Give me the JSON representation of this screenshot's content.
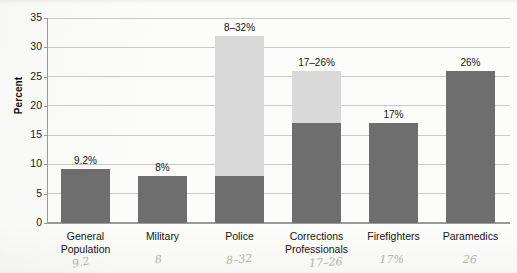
{
  "chart_data": {
    "type": "bar",
    "title": "",
    "xlabel": "",
    "ylabel": "Percent",
    "ylim": [
      0,
      35
    ],
    "ytick_step": 5,
    "yticks": [
      "0",
      "5",
      "10",
      "15",
      "20",
      "25",
      "30",
      "35"
    ],
    "grid": true,
    "legend": "none",
    "categories": [
      "General\nPopulation",
      "Military",
      "Police",
      "Corrections\nProfessionals",
      "Firefighters",
      "Paramedics"
    ],
    "category_lines": [
      [
        "General",
        "Population"
      ],
      [
        "Military",
        ""
      ],
      [
        "Police",
        ""
      ],
      [
        "Corrections",
        "Professionals"
      ],
      [
        "Firefighters",
        ""
      ],
      [
        "Paramedics",
        ""
      ]
    ],
    "series": [
      {
        "name": "Lower bound",
        "values": [
          9.2,
          8,
          8,
          17,
          17,
          26
        ]
      },
      {
        "name": "Upper bound",
        "values": [
          9.2,
          8,
          32,
          26,
          17,
          26
        ]
      }
    ],
    "data_labels": [
      "9.2%",
      "8%",
      "8–32%",
      "17–26%",
      "17%",
      "26%"
    ],
    "bars": [
      {
        "category": "General Population",
        "low": 9.2,
        "high": 9.2,
        "label": "9.2%",
        "is_range": false
      },
      {
        "category": "Military",
        "low": 8,
        "high": 8,
        "label": "8%",
        "is_range": false
      },
      {
        "category": "Police",
        "low": 8,
        "high": 32,
        "label": "8–32%",
        "is_range": true
      },
      {
        "category": "Corrections Professionals",
        "low": 17,
        "high": 26,
        "label": "17–26%",
        "is_range": true
      },
      {
        "category": "Firefighters",
        "low": 17,
        "high": 17,
        "label": "17%",
        "is_range": false
      },
      {
        "category": "Paramedics",
        "low": 26,
        "high": 26,
        "label": "26%",
        "is_range": false
      }
    ],
    "colors": {
      "bar_dark": "#6e6e6e",
      "bar_light": "#d9d9d9",
      "gridline": "#c9c9c9",
      "axis": "#9a9a9a",
      "text": "#141414",
      "background": "#fcfcfa"
    }
  },
  "annotations": {
    "handwritten": [
      {
        "text": "9.2",
        "under": "General Population"
      },
      {
        "text": "8",
        "under": "Military"
      },
      {
        "text": "8–32",
        "under": "Police"
      },
      {
        "text": "17–26",
        "under": "Corrections Professionals"
      },
      {
        "text": "17%",
        "under": "Firefighters"
      },
      {
        "text": "26",
        "under": "Paramedics"
      }
    ]
  }
}
